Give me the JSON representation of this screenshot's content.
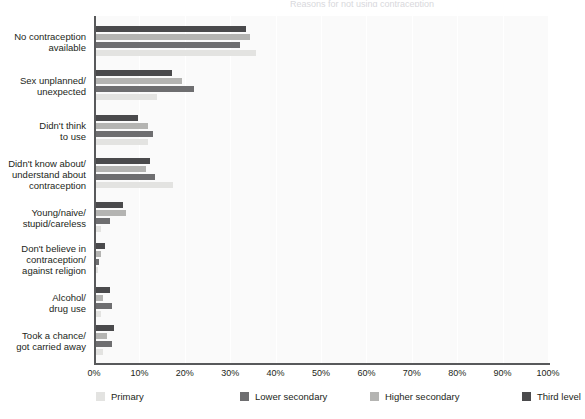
{
  "title_sliver": "Reasons for not using contraception",
  "axis": {
    "x_ticks": [
      "0%",
      "10%",
      "20%",
      "30%",
      "40%",
      "50%",
      "60%",
      "70%",
      "80%",
      "90%",
      "100%"
    ]
  },
  "legend": {
    "items": [
      {
        "label": "Primary",
        "color": "#e3e3e1"
      },
      {
        "label": "Lower secondary",
        "color": "#6e6e70"
      },
      {
        "label": "Higher secondary",
        "color": "#b4b4b2"
      },
      {
        "label": "Third level",
        "color": "#4a4a4c"
      }
    ]
  },
  "chart_data": {
    "type": "bar",
    "orientation": "horizontal",
    "title": "Reasons for not using contraception",
    "xlabel": "",
    "ylabel": "",
    "xlim": [
      0,
      100
    ],
    "xunit": "%",
    "grid": true,
    "legend_position": "bottom",
    "categories": [
      "No contraception available",
      "Sex unplanned/ unexpected",
      "Didn't think to use",
      "Didn't know about/ understand about contraception",
      "Young/naive/ stupid/careless",
      "Don't believe in contraception/ against religion",
      "Alcohol/ drug use",
      "Took a chance/ got carried away"
    ],
    "series": [
      {
        "name": "Third level",
        "color": "#4a4a4c",
        "values": [
          33.0,
          16.8,
          9.2,
          12.0,
          6.0,
          2.0,
          3.0,
          4.0
        ]
      },
      {
        "name": "Higher secondary",
        "color": "#b4b4b2",
        "values": [
          34.0,
          19.0,
          11.5,
          11.0,
          6.5,
          1.0,
          1.5,
          2.5
        ]
      },
      {
        "name": "Lower secondary",
        "color": "#6e6e70",
        "values": [
          31.8,
          21.5,
          12.5,
          13.0,
          3.0,
          0.6,
          3.5,
          3.5
        ]
      },
      {
        "name": "Primary",
        "color": "#e3e3e1",
        "values": [
          35.2,
          13.5,
          11.5,
          17.0,
          1.2,
          0.4,
          1.0,
          1.5
        ]
      }
    ]
  },
  "category_rows": [
    {
      "label_line1": "No contraception",
      "label_line2": "available"
    },
    {
      "label_line1": "Sex unplanned/",
      "label_line2": "unexpected"
    },
    {
      "label_line1": "Didn't think",
      "label_line2": "to use"
    },
    {
      "label_line1": "Didn't know about/",
      "label_line2": "understand about",
      "label_line3": "contraception"
    },
    {
      "label_line1": "Young/naive/",
      "label_line2": "stupid/careless"
    },
    {
      "label_line1": "Don't believe in",
      "label_line2": "contraception/",
      "label_line3": "against religion"
    },
    {
      "label_line1": "Alcohol/",
      "label_line2": "drug use"
    },
    {
      "label_line1": "Took a chance/",
      "label_line2": "got carried away"
    }
  ]
}
